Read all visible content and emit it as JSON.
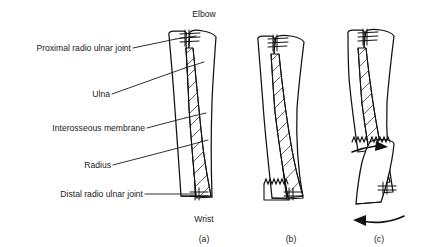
{
  "figure": {
    "title_top": "Elbow",
    "title_bottom": "Wrist",
    "labels": [
      {
        "id": "proximal-radio-ulnar-joint",
        "text": "Proximal radio ulnar joint",
        "x": 152,
        "y": 48
      },
      {
        "id": "ulna",
        "text": "Ulna",
        "x": 106,
        "y": 97
      },
      {
        "id": "interosseous-membrane",
        "text": "Interosseous membrane",
        "x": 142,
        "y": 131
      },
      {
        "id": "radius",
        "text": "Radius",
        "x": 110,
        "y": 163
      },
      {
        "id": "distal-radio-ulnar-joint",
        "text": "Distal radio ulnar joint",
        "x": 140,
        "y": 196
      }
    ],
    "panels": [
      {
        "id": "panel-a",
        "caption": "(a)",
        "cx": 204,
        "cy": 239,
        "description": "Normal forearm: radius and ulna joined by interosseous membrane, proximal and distal radio ulnar joints intact"
      },
      {
        "id": "panel-b",
        "caption": "(b)",
        "cx": 290,
        "cy": 239,
        "description": "Fracture of the distal radius without displacement"
      },
      {
        "id": "panel-c",
        "caption": "(c)",
        "cx": 378,
        "cy": 239,
        "description": "Displaced radius fracture with rotation of the distal fragment"
      }
    ],
    "annotations": {
      "elbow_x": 204,
      "elbow_y": 14,
      "wrist_x": 204,
      "wrist_y": 219
    },
    "colors": {
      "ink": "#111111",
      "text": "#1a1a1a",
      "hatch": "#444444",
      "background": "#ffffff"
    }
  }
}
